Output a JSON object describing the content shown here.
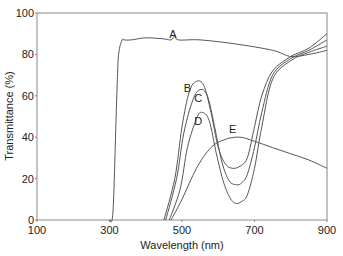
{
  "chart_data": {
    "type": "line",
    "title": "",
    "xlabel": "Wavelength (nm)",
    "ylabel": "Transmittance (%)",
    "xlim": [
      100,
      900
    ],
    "ylim": [
      0,
      100
    ],
    "xticks": [
      100,
      300,
      500,
      700,
      900
    ],
    "yticks": [
      0,
      20,
      40,
      60,
      80,
      100
    ],
    "grid": false,
    "legend": "none (curves labeled inline A–E)",
    "series": [
      {
        "name": "A",
        "label_pos": [
          475,
          88
        ],
        "x": [
          300,
          310,
          320,
          325,
          335,
          340,
          360,
          400,
          450,
          470,
          480,
          490,
          550,
          650,
          750,
          800,
          850,
          900
        ],
        "y": [
          0,
          5,
          60,
          80,
          87,
          87,
          87,
          88,
          87.5,
          87,
          89,
          87,
          87,
          85,
          82,
          79,
          80,
          82
        ]
      },
      {
        "name": "B",
        "label_pos": [
          515,
          62
        ],
        "x": [
          450,
          480,
          500,
          520,
          540,
          560,
          580,
          600,
          620,
          640,
          660,
          680,
          700,
          720,
          750,
          800,
          850,
          900
        ],
        "y": [
          0,
          20,
          45,
          62,
          67,
          65,
          52,
          35,
          27,
          25,
          26,
          30,
          45,
          60,
          72,
          79,
          83,
          90
        ]
      },
      {
        "name": "C",
        "label_pos": [
          545,
          57
        ],
        "x": [
          455,
          485,
          505,
          530,
          550,
          570,
          590,
          610,
          630,
          650,
          665,
          680,
          700,
          720,
          750,
          800,
          850,
          900
        ],
        "y": [
          0,
          20,
          42,
          58,
          63,
          60,
          45,
          28,
          19,
          17,
          18,
          22,
          35,
          52,
          70,
          78,
          82,
          87
        ]
      },
      {
        "name": "D",
        "label_pos": [
          545,
          46
        ],
        "x": [
          465,
          495,
          515,
          540,
          555,
          575,
          595,
          615,
          635,
          650,
          665,
          680,
          700,
          720,
          750,
          800,
          850,
          900
        ],
        "y": [
          0,
          15,
          35,
          49,
          52,
          48,
          32,
          18,
          10,
          8,
          9,
          12,
          25,
          45,
          68,
          77,
          81,
          84
        ]
      },
      {
        "name": "E",
        "label_pos": [
          640,
          42
        ],
        "x": [
          470,
          500,
          540,
          580,
          620,
          660,
          700,
          750,
          800,
          850,
          900
        ],
        "y": [
          0,
          10,
          25,
          35,
          39,
          40,
          38,
          35,
          32,
          29,
          25
        ]
      }
    ]
  },
  "labels": {
    "xlabel": "Wavelength (nm)",
    "ylabel": "Transmittance (%)"
  },
  "colors": {
    "line": "#555555",
    "axis": "#888888",
    "text": "#222222"
  }
}
